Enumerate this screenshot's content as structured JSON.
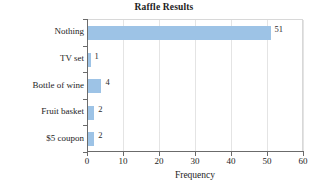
{
  "chart_data": {
    "type": "bar",
    "orientation": "horizontal",
    "title": "Raffle Results",
    "xlabel": "Frequency",
    "ylabel": "",
    "categories": [
      "Nothing",
      "TV set",
      "Bottle of wine",
      "Fruit basket",
      "$5 coupon"
    ],
    "values": [
      51,
      1,
      4,
      2,
      2
    ],
    "data_labels": [
      "51",
      "1",
      "4",
      "2",
      "2"
    ],
    "xlim": [
      0,
      60
    ],
    "xticks": [
      0,
      10,
      20,
      30,
      40,
      50,
      60
    ],
    "xtick_labels": [
      "0",
      "10",
      "20",
      "30",
      "40",
      "50",
      "60"
    ],
    "grid": "vertical",
    "legend": "none",
    "bar_color": "#9dc3e6",
    "gridline_color": "#e4e4e4",
    "axis_color": "#6b6b6b",
    "background_color": "#ffffff"
  }
}
